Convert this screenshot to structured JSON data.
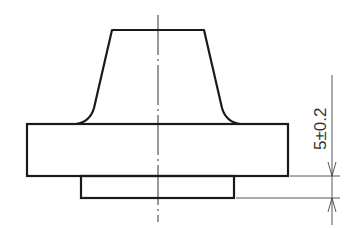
{
  "drawing": {
    "type": "technical-drawing-front-view",
    "dimension": {
      "label": "5±0.2",
      "nominal": 5,
      "tolerance": "±0.2"
    },
    "colors": {
      "outline": "#1a1a1a",
      "thin": "#333333",
      "background": "#ffffff"
    }
  }
}
